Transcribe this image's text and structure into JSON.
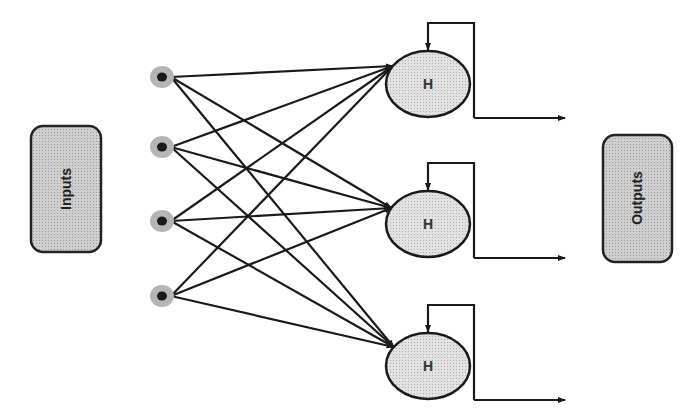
{
  "diagram": {
    "type": "recurrent-neural-network",
    "inputs_box": {
      "label": "Inputs"
    },
    "outputs_box": {
      "label": "Outputs"
    },
    "input_nodes": [
      {
        "id": "i1",
        "cx": 162,
        "cy": 77
      },
      {
        "id": "i2",
        "cx": 162,
        "cy": 147
      },
      {
        "id": "i3",
        "cx": 162,
        "cy": 221
      },
      {
        "id": "i4",
        "cx": 162,
        "cy": 296
      }
    ],
    "hidden_nodes": [
      {
        "id": "h1",
        "label": "H",
        "cx": 428,
        "cy": 84,
        "target_y": 66
      },
      {
        "id": "h2",
        "label": "H",
        "cx": 428,
        "cy": 224,
        "target_y": 208
      },
      {
        "id": "h3",
        "label": "H",
        "cx": 428,
        "cy": 366,
        "target_y": 347
      }
    ],
    "connections": "fully-connected: every input node to every hidden node",
    "recurrent_feedback": "each hidden node has a self-loop from its right side back to its top",
    "outputs": "each hidden node emits an arrow to the right toward Outputs",
    "colors": {
      "line": "#1a1a1a",
      "box_fill": "#c4c4c4",
      "node_fill": "#d9d9d9",
      "input_halo": "#b5b5b5",
      "input_core": "#1a1a1a"
    }
  }
}
